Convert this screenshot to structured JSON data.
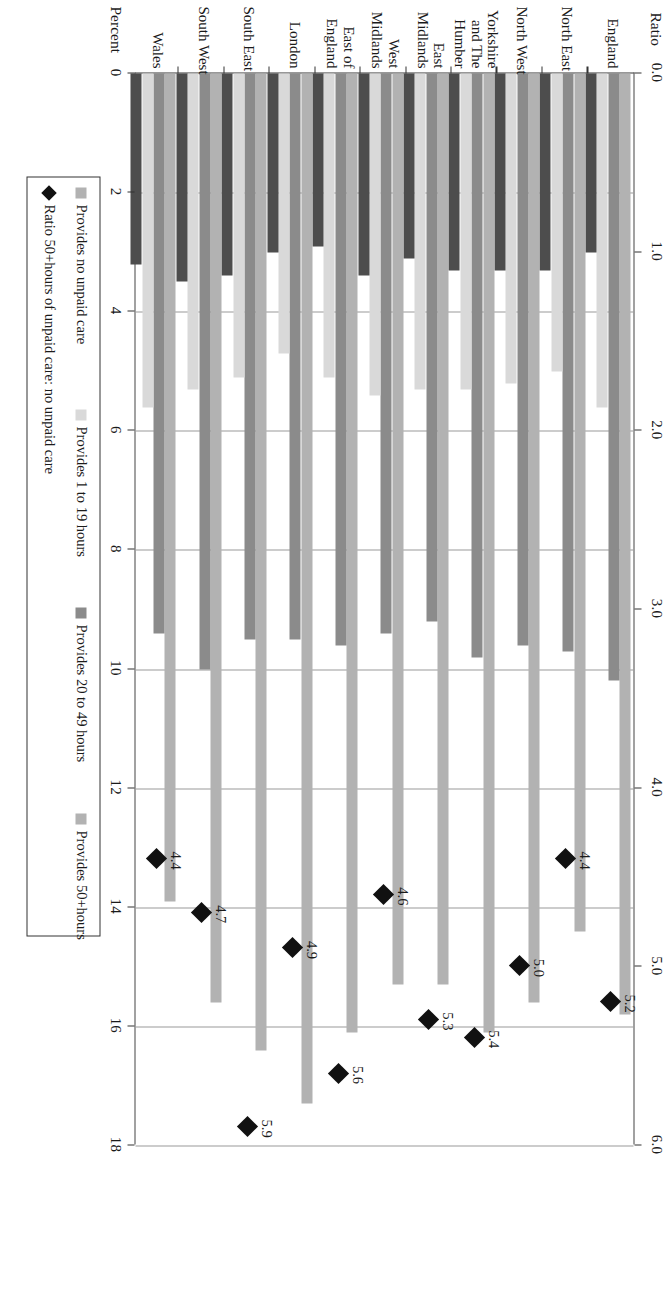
{
  "chart_data": {
    "type": "bar",
    "title": "",
    "orientation": "horizontal-rotated",
    "categories": [
      "England",
      "North East",
      "North West",
      "Yorkshire and The Humber",
      "East Midlands",
      "West Midlands",
      "East of England",
      "London",
      "South East",
      "South West",
      "Wales"
    ],
    "category_lines": [
      [
        "England"
      ],
      [
        "North East"
      ],
      [
        "North West"
      ],
      [
        "Yorkshire",
        "and The",
        "Humber"
      ],
      [
        "East",
        "Midlands"
      ],
      [
        "West",
        "Midlands"
      ],
      [
        "East of",
        "England"
      ],
      [
        "London"
      ],
      [
        "South East"
      ],
      [
        "South West"
      ],
      [
        "Wales"
      ]
    ],
    "series": [
      {
        "name": "Provides no unpaid care",
        "color": "#b2b2b2",
        "axis": "percent",
        "values": [
          15.8,
          14.4,
          15.6,
          16.1,
          15.3,
          15.3,
          16.1,
          17.3,
          16.4,
          15.6,
          13.9
        ]
      },
      {
        "name": "Provides 20 to 49 hours",
        "color": "#8b8b8b",
        "axis": "percent",
        "values": [
          10.2,
          9.7,
          9.6,
          9.8,
          9.2,
          9.4,
          9.6,
          9.5,
          9.5,
          10.0,
          9.4
        ]
      },
      {
        "name": "Provides 1 to 19 hours",
        "color": "#d9d9d9",
        "axis": "percent",
        "values": [
          5.6,
          5.0,
          5.2,
          5.3,
          5.3,
          5.4,
          5.1,
          4.7,
          5.1,
          5.3,
          5.6
        ]
      },
      {
        "name": "Provides 50+hours",
        "color": "#4d4d4d",
        "axis": "percent",
        "values": [
          3.0,
          3.3,
          3.3,
          3.3,
          3.1,
          3.4,
          2.9,
          3.0,
          3.4,
          3.5,
          3.2
        ]
      },
      {
        "name": "Ratio 50+hours of unpaid care: no unpaid care",
        "color": "#111111",
        "axis": "ratio",
        "marker": "diamond",
        "values": [
          5.2,
          4.4,
          5.0,
          5.4,
          5.3,
          4.6,
          5.6,
          4.9,
          5.9,
          4.7,
          4.4
        ],
        "labels": [
          "5.2",
          "4.4",
          "5.0",
          "5.4",
          "5.3",
          "4.6",
          "5.6",
          "4.9",
          "5.9",
          "4.7",
          "4.4"
        ]
      }
    ],
    "xlabel": "Percent",
    "x2label": "Ratio",
    "ylabel": "",
    "xlim": [
      0,
      18
    ],
    "xticks": [
      0,
      2,
      4,
      6,
      8,
      10,
      12,
      14,
      16,
      18
    ],
    "xticklabels": [
      "0",
      "2",
      "4",
      "6",
      "8",
      "10",
      "12",
      "14",
      "16",
      "18"
    ],
    "x2lim": [
      0,
      6.0
    ],
    "x2ticks": [
      0.0,
      1.0,
      2.0,
      3.0,
      4.0,
      5.0,
      6.0
    ],
    "x2ticklabels": [
      "0.0",
      "1.0",
      "2.0",
      "3.0",
      "4.0",
      "5.0",
      "6.0"
    ],
    "grid": true,
    "legend_position": "below-right"
  },
  "axes": {
    "percent_title": "Percent",
    "ratio_title": "Ratio"
  },
  "legend": {
    "items": [
      {
        "label": "Provides no unpaid care",
        "swatch": "#b2b2b2",
        "marker": "square",
        "icon": "legend-square-icon"
      },
      {
        "label": "Provides 1 to 19 hours",
        "swatch": "#d9d9d9",
        "marker": "square",
        "icon": "legend-square-icon"
      },
      {
        "label": "Provides 20 to 49 hours",
        "swatch": "#8b8b8b",
        "marker": "square",
        "icon": "legend-square-icon"
      },
      {
        "label": "Provides 50+hours",
        "swatch": "#b2b2b2",
        "marker": "square",
        "icon": "legend-square-icon"
      },
      {
        "label": "Ratio 50+hours of unpaid care: no unpaid care",
        "swatch": "#111111",
        "marker": "diamond",
        "icon": "legend-diamond-icon"
      }
    ]
  }
}
